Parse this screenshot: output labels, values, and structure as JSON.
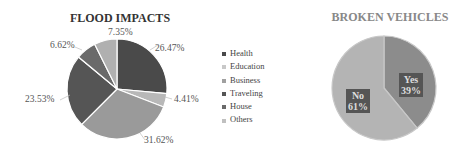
{
  "chart_data": [
    {
      "type": "pie",
      "title": "FLOOD IMPACTS",
      "categories": [
        "Health",
        "Education",
        "Business",
        "Traveling",
        "House",
        "Others"
      ],
      "values": [
        26.47,
        4.41,
        31.62,
        23.53,
        6.62,
        7.35
      ],
      "labels": [
        "26.47%",
        "4.41%",
        "31.62%",
        "23.53%",
        "6.62%",
        "7.35%"
      ],
      "colors": [
        "#4a4a4a",
        "#b8b8b8",
        "#9a9a9a",
        "#555555",
        "#6a6a6a",
        "#b0b0b0"
      ],
      "legend_position": "right"
    },
    {
      "type": "pie",
      "title": "BROKEN VEHICLES",
      "categories": [
        "Yes",
        "No"
      ],
      "values": [
        39,
        61
      ],
      "labels": [
        "Yes\n39%",
        "No\n61%"
      ],
      "colors": [
        "#8c8c8c",
        "#b4b4b4"
      ]
    }
  ],
  "chart1": {
    "title": "FLOOD IMPACTS",
    "labels": {
      "health": "26.47%",
      "education": "4.41%",
      "business": "31.62%",
      "traveling": "23.53%",
      "house": "6.62%",
      "others": "7.35%"
    },
    "legend": [
      "Health",
      "Education",
      "Business",
      "Traveling",
      "House",
      "Others"
    ]
  },
  "chart2": {
    "title": "BROKEN VEHICLES",
    "yes_label": "Yes",
    "yes_value": "39%",
    "no_label": "No",
    "no_value": "61%"
  }
}
